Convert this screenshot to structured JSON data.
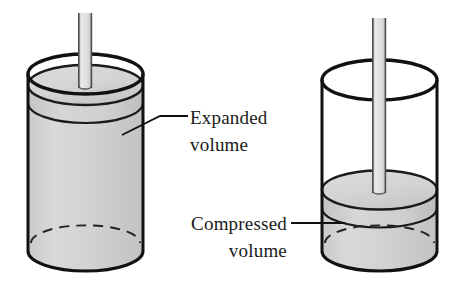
{
  "figure": {
    "background_color": "#ffffff",
    "outline_color": "#111111",
    "fill_color": "#d0d0d0",
    "piston_fill_color": "#c6c6c6",
    "rod_fill_color": "#d8d8d8",
    "dashed_color": "#222222"
  },
  "labels": {
    "expanded_line1": "Expanded",
    "expanded_line2": "volume",
    "compressed_line1": "Compressed",
    "compressed_line2": "volume"
  },
  "diagrams": [
    {
      "name": "expanded-cylinder",
      "state": "expanded",
      "piston_position": "top",
      "gas_fill": "large"
    },
    {
      "name": "compressed-cylinder",
      "state": "compressed",
      "piston_position": "lower",
      "gas_fill": "small"
    }
  ]
}
